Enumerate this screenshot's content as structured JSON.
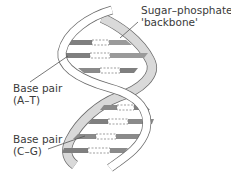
{
  "diagram": {
    "labels": {
      "backbone_line1": "Sugar–phosphate",
      "backbone_line2": "'backbone'",
      "at_line1": "Base pair",
      "at_line2": "(A–T)",
      "cg_line1": "Base pair",
      "cg_line2": "(C–G)"
    },
    "colors": {
      "strand_front": "#ffffff",
      "strand_back": "#d9d9d9",
      "outline": "#6b6b6b",
      "base_dark": "#7f7f7f",
      "base_light": "#b3b3b3",
      "text": "#3a3a3a"
    },
    "base_pairs": [
      {
        "y": 42,
        "x1": 80,
        "x2": 125
      },
      {
        "y": 55,
        "x1": 63,
        "x2": 145
      },
      {
        "y": 70,
        "x1": 78,
        "x2": 135
      },
      {
        "y": 107,
        "x1": 103,
        "x2": 148
      },
      {
        "y": 121,
        "x1": 93,
        "x2": 155
      },
      {
        "y": 136,
        "x1": 76,
        "x2": 148
      },
      {
        "y": 150,
        "x1": 63,
        "x2": 130
      }
    ]
  }
}
